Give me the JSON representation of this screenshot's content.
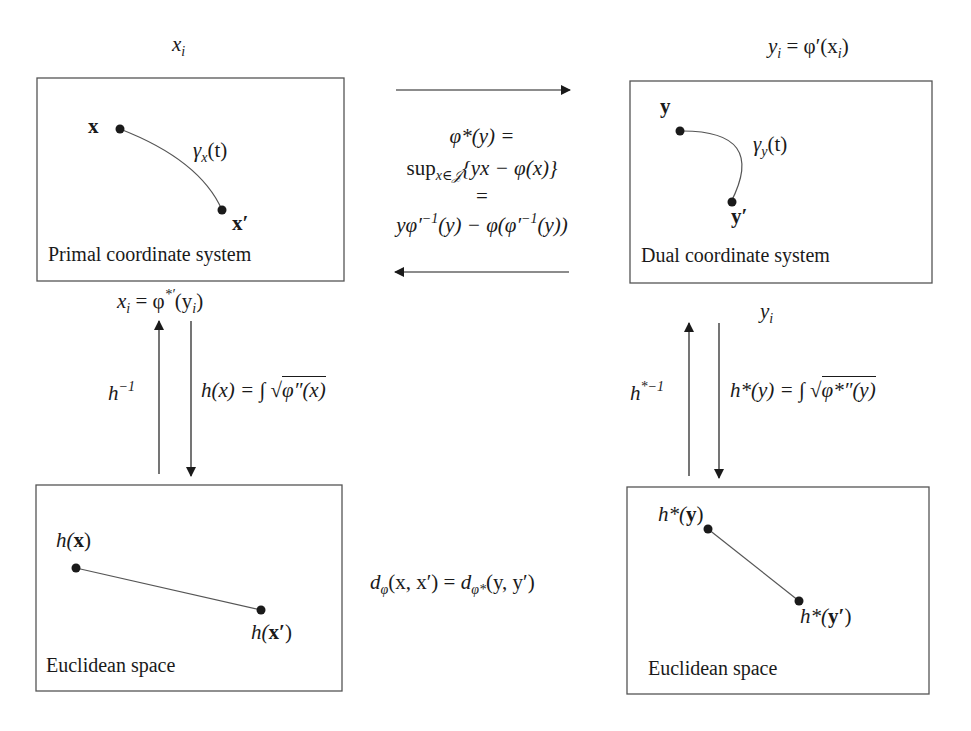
{
  "diagram": {
    "colors": {
      "stroke": "#555555",
      "text": "#1a1a1a",
      "point": "#1a1a1a",
      "background": "#ffffff"
    },
    "boxes": {
      "primal": {
        "caption": "Primal coordinate system",
        "point_a": "x",
        "point_b": "x′",
        "curve_label": "γ",
        "curve_sub": "x",
        "curve_arg": "(t)"
      },
      "dual": {
        "caption": "Dual coordinate system",
        "point_a": "y",
        "point_b": "y′",
        "curve_label": "γ",
        "curve_sub": "y",
        "curve_arg": "(t)"
      },
      "euclid_left": {
        "caption": "Euclidean space",
        "point_a_fn": "h(",
        "point_a": "x",
        "point_a_close": ")",
        "point_b_fn": "h(",
        "point_b": "x′",
        "point_b_close": ")"
      },
      "euclid_right": {
        "caption": "Euclidean space",
        "point_a_fn": "h*(",
        "point_a": "y",
        "point_a_close": ")",
        "point_b_fn": "h*(",
        "point_b": "y′",
        "point_b_close": ")"
      }
    },
    "labels": {
      "top_left": {
        "base": "x",
        "sub": "i"
      },
      "top_right": {
        "lhs": "y",
        "lhs_sub": "i",
        "rhs": " = φ′(x",
        "rhs_sub": "i",
        "close": ")"
      },
      "below_primal": {
        "lhs": "x",
        "lhs_sub": "i",
        "eq": " = φ",
        "sup": "*′",
        "arg": "(y",
        "arg_sub": "i",
        "close": ")"
      },
      "below_dual": {
        "base": "y",
        "sub": "i"
      },
      "legendre": {
        "line1": "φ*(y) =",
        "line2_op": "sup",
        "line2_sub": "x∈𝒥",
        "line2_rest": "{yx − φ(x)}",
        "line3": "=",
        "line4_a": "yφ′",
        "line4_sup1": "−1",
        "line4_b": "(y) − φ(φ′",
        "line4_sup2": "−1",
        "line4_c": "(y))"
      },
      "h_inverse": {
        "base": "h",
        "sup": "−1"
      },
      "h_def": {
        "lhs": "h(x) = ∫ ",
        "root": "φ″(x)"
      },
      "hstar_inverse": {
        "base": "h",
        "sup": "*−1"
      },
      "hstar_def": {
        "lhs": "h*(y) = ∫ ",
        "root": "φ*″(y)"
      },
      "divergence": {
        "d1": "d",
        "d1_sub": "φ",
        "args1": "(x, x′)",
        "eq": " = ",
        "d2": "d",
        "d2_sub": "φ*",
        "args2": "(y, y′)"
      }
    },
    "arrows": [
      {
        "id": "primal-to-dual",
        "direction": "right"
      },
      {
        "id": "dual-to-primal",
        "direction": "left"
      },
      {
        "id": "euclid-to-primal",
        "direction": "up",
        "label": "h⁻¹"
      },
      {
        "id": "primal-to-euclid",
        "direction": "down",
        "label": "h(x)"
      },
      {
        "id": "euclid-to-dual",
        "direction": "up",
        "label": "h*⁻¹"
      },
      {
        "id": "dual-to-euclid",
        "direction": "down",
        "label": "h*(y)"
      }
    ]
  }
}
